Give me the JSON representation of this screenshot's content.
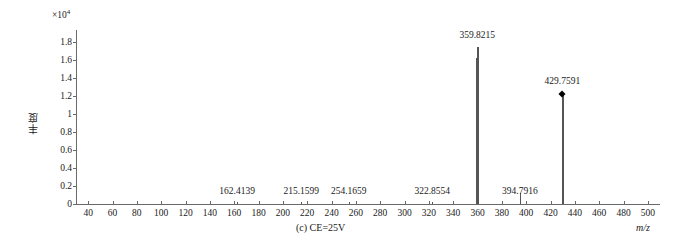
{
  "chart_data": {
    "type": "bar",
    "title": "",
    "caption": "(c) CE=25V",
    "xlabel": "m/z",
    "ylabel": "丰度",
    "y_multiplier": "×10",
    "y_exponent": "4",
    "xlim": [
      30,
      510
    ],
    "ylim": [
      0,
      1.9
    ],
    "xticks": [
      40,
      60,
      80,
      100,
      120,
      140,
      160,
      180,
      200,
      220,
      240,
      260,
      280,
      300,
      320,
      340,
      360,
      380,
      400,
      420,
      440,
      460,
      480,
      500
    ],
    "yticks": [
      "0",
      "0.2",
      "0.4",
      "0.6",
      "0.8",
      "1",
      "1.2",
      "1.4",
      "1.6",
      "1.8"
    ],
    "ytick_values": [
      0,
      0.2,
      0.4,
      0.6,
      0.8,
      1.0,
      1.2,
      1.4,
      1.6,
      1.8
    ],
    "grid": false,
    "legend": false,
    "peaks": [
      {
        "mz": 162.4139,
        "label": "162.4139",
        "intensity": 0.02,
        "labeled": true,
        "marker": "none"
      },
      {
        "mz": 215.1599,
        "label": "215.1599",
        "intensity": 0.02,
        "labeled": true,
        "marker": "none"
      },
      {
        "mz": 254.1659,
        "label": "254.1659",
        "intensity": 0.02,
        "labeled": true,
        "marker": "none"
      },
      {
        "mz": 322.8554,
        "label": "322.8554",
        "intensity": 0.02,
        "labeled": true,
        "marker": "none"
      },
      {
        "mz": 358.9,
        "label": "",
        "intensity": 1.62,
        "labeled": false,
        "marker": "none"
      },
      {
        "mz": 359.8215,
        "label": "359.8215",
        "intensity": 1.75,
        "labeled": true,
        "marker": "none"
      },
      {
        "mz": 394.7916,
        "label": "394.7916",
        "intensity": 0.12,
        "labeled": true,
        "marker": "none"
      },
      {
        "mz": 429.7591,
        "label": "429.7591",
        "intensity": 1.22,
        "labeled": true,
        "marker": "diamond"
      }
    ]
  }
}
